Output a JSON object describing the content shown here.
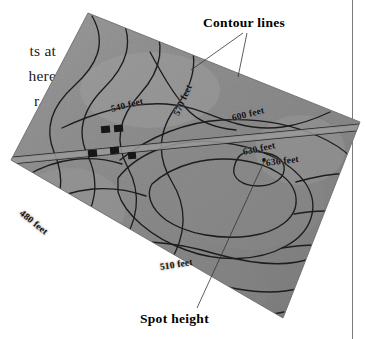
{
  "figure": {
    "type": "annotated-contour-map-photograph"
  },
  "page_text": {
    "lines": [
      "ts at",
      "here",
      "r, it"
    ]
  },
  "annotations": [
    {
      "id": "contour-lines",
      "label": "Contour lines"
    },
    {
      "id": "spot-height",
      "label": "Spot height"
    }
  ],
  "contour_labels": [
    {
      "id": "c480",
      "value": 480,
      "label": "480 feet"
    },
    {
      "id": "c510",
      "value": 510,
      "label": "510 feet"
    },
    {
      "id": "c540",
      "value": 540,
      "label": "540 feet"
    },
    {
      "id": "c570",
      "value": 570,
      "label": "570 feet"
    },
    {
      "id": "c600",
      "value": 600,
      "label": "600 feet"
    },
    {
      "id": "c630",
      "value": 630,
      "label": "630 feet"
    },
    {
      "id": "c636",
      "value": 636,
      "label": "636 feet",
      "kind": "spot-height"
    }
  ],
  "map_features": {
    "road_label": "road",
    "buildings_count": 5,
    "spot_height_marker": "dot"
  },
  "colors": {
    "page_background": "#ffffff",
    "map_fill_light": "#a2a2a2",
    "map_fill_mid": "#8e8e8e",
    "map_fill_dark": "#6f6f6f",
    "contour_line": "#1c1c1c",
    "text": "#000000",
    "rule": "#7b7b7b"
  }
}
